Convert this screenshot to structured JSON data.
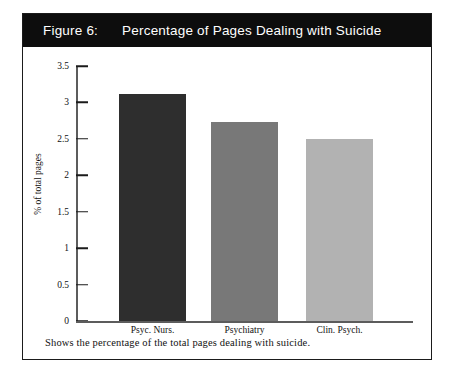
{
  "figure": {
    "number_label": "Figure 6:",
    "title": "Percentage of Pages Dealing with Suicide",
    "caption": "Shows the percentage of the total pages dealing with suicide.",
    "header_background": "#0d0d0d",
    "header_text_color": "#ffffff",
    "frame_border_color": "#1b1b1b"
  },
  "chart_data": {
    "type": "bar",
    "title": "Percentage of Pages Dealing with Suicide",
    "categories": [
      "Psyc. Nurs.",
      "Psychiatry",
      "Clin. Psych."
    ],
    "values": [
      3.12,
      2.73,
      2.5
    ],
    "series": [
      {
        "name": "% of total pages",
        "values": [
          3.12,
          2.73,
          2.5
        ]
      }
    ],
    "bar_colors": [
      "#2e2e2e",
      "#787878",
      "#b2b2b2"
    ],
    "xlabel": "",
    "ylabel": "% of total pages",
    "ylim": [
      0,
      3.5
    ],
    "yticks": [
      0,
      0.5,
      1,
      1.5,
      2,
      2.5,
      3,
      3.5
    ],
    "ytick_labels": [
      "0",
      "0.5",
      "1",
      "1.5",
      "2",
      "2.5",
      "3",
      "3.5"
    ],
    "grid": false,
    "legend": false,
    "axis_color": "#5c5c5c"
  }
}
